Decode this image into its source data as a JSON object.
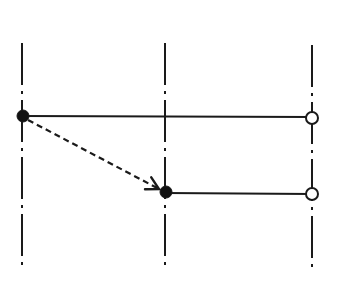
{
  "diagram": {
    "width": 349,
    "height": 287,
    "colors": {
      "background": "#ffffff",
      "stroke": "#1a1a1a",
      "filled_node": "#111111",
      "open_node_fill": "#ffffff"
    },
    "vertical_lines": [
      {
        "id": "axis-left",
        "x": 22,
        "y1": 43,
        "y2": 270,
        "style": "dash-dot"
      },
      {
        "id": "axis-middle",
        "x": 165,
        "y1": 43,
        "y2": 271,
        "style": "dash-dot"
      },
      {
        "id": "axis-right",
        "x": 312,
        "y1": 45,
        "y2": 272,
        "style": "dash-dot"
      }
    ],
    "horizontal_lines": [
      {
        "id": "track-upper",
        "x1": 22,
        "x2": 312,
        "y": 116,
        "start_node": "filled",
        "end_node": "open"
      },
      {
        "id": "track-lower",
        "x1": 165,
        "x2": 312,
        "y": 193,
        "start_node": "filled",
        "end_node": "open"
      }
    ],
    "nodes": [
      {
        "id": "node-upper-start",
        "x": 23,
        "y": 116,
        "type": "filled",
        "r": 6
      },
      {
        "id": "node-upper-end",
        "x": 312,
        "y": 118,
        "type": "open",
        "r": 6
      },
      {
        "id": "node-lower-start",
        "x": 166,
        "y": 192,
        "type": "filled",
        "r": 6
      },
      {
        "id": "node-lower-end",
        "x": 312,
        "y": 194,
        "type": "open",
        "r": 6
      }
    ],
    "arrows": [
      {
        "id": "transfer-arrow",
        "from": "node-upper-start",
        "to": "node-lower-start",
        "style": "dashed",
        "x1": 28,
        "y1": 120,
        "x2": 159,
        "y2": 189
      }
    ]
  }
}
